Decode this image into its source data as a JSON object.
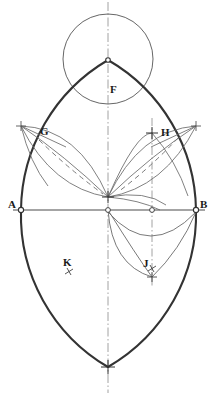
{
  "figure": {
    "background_color": "#ffffff",
    "ink_color": "#2b2b2b",
    "heavy_stroke_color": "#3a3a3a",
    "light_stroke_color": "#6e6e6e",
    "width": 218,
    "height": 395
  },
  "labels": [
    {
      "id": "A",
      "text": "A",
      "x": 8,
      "y": 202
    },
    {
      "id": "B",
      "text": "B",
      "x": 200,
      "y": 202
    },
    {
      "id": "F",
      "text": "F",
      "x": 110,
      "y": 84
    },
    {
      "id": "G",
      "text": "G",
      "x": 40,
      "y": 126
    },
    {
      "id": "H",
      "text": "H",
      "x": 161,
      "y": 127
    },
    {
      "id": "J",
      "text": "J",
      "x": 143,
      "y": 263
    },
    {
      "id": "K",
      "text": "K",
      "x": 63,
      "y": 258
    }
  ],
  "points": {
    "A": {
      "x": 21,
      "y": 210,
      "marker": "circle",
      "label": "A"
    },
    "B": {
      "x": 196,
      "y": 210,
      "marker": "circle",
      "label": "B"
    },
    "center": {
      "x": 108,
      "y": 210,
      "marker": "circle",
      "label": ""
    },
    "midright": {
      "x": 152,
      "y": 210,
      "marker": "circle",
      "label": ""
    },
    "node": {
      "x": 108,
      "y": 197,
      "marker": "cross",
      "label": ""
    },
    "apex": {
      "x": 108,
      "y": 60,
      "marker": "circle",
      "label": ""
    },
    "bottom": {
      "x": 108,
      "y": 367,
      "marker": "cross",
      "label": ""
    },
    "G_tip": {
      "x": 21,
      "y": 126,
      "marker": "cross",
      "label": "G"
    },
    "H_tip": {
      "x": 196,
      "y": 126,
      "marker": "cross",
      "label": "H"
    },
    "H_cross": {
      "x": 152,
      "y": 133,
      "marker": "cross",
      "label": ""
    },
    "J_cross": {
      "x": 152,
      "y": 277,
      "marker": "cross",
      "label": ""
    },
    "J_tick": {
      "x": 152,
      "y": 268,
      "marker": "tick",
      "label": ""
    },
    "K_tick": {
      "x": 69,
      "y": 272,
      "marker": "tick",
      "label": ""
    }
  },
  "construction": {
    "circle_F": {
      "cx": 108,
      "cy": 59,
      "r": 45,
      "note": "upper circle through apex"
    },
    "axis_vertical": {
      "x": 108,
      "y1": 0,
      "y2": 395,
      "style": "dash-dot"
    },
    "axis_right": {
      "x": 152,
      "y1": 118,
      "y2": 285,
      "style": "dash-dot"
    },
    "baseline_AB": {
      "x1": 14,
      "y1": 210,
      "x2": 204,
      "y2": 210,
      "style": "solid"
    },
    "arch_radius": 175,
    "petal_count": 4
  },
  "legend": {
    "dash_dot": "centre line",
    "dashed": "construction chord",
    "solid_heavy": "principal arch outline",
    "solid_light": "auxiliary arcs"
  }
}
